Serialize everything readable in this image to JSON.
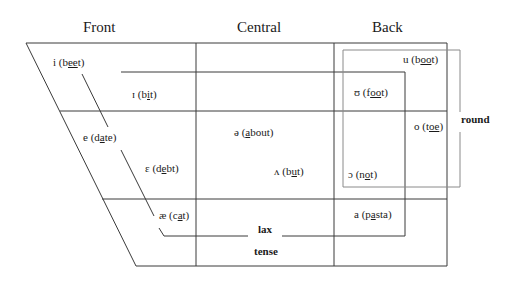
{
  "headers": {
    "front": "Front",
    "central": "Central",
    "back": "Back"
  },
  "vowels": [
    {
      "symbol": "i",
      "pre": "b",
      "ul": "ee",
      "post": "t"
    },
    {
      "symbol": "ɪ",
      "pre": "b",
      "ul": "i",
      "post": "t"
    },
    {
      "symbol": "e",
      "pre": "d",
      "ul": "a",
      "post": "te"
    },
    {
      "symbol": "ɛ",
      "pre": "d",
      "ul": "e",
      "post": "bt"
    },
    {
      "symbol": "æ",
      "pre": "c",
      "ul": "a",
      "post": "t"
    },
    {
      "symbol": "ə",
      "pre": "",
      "ul": "a",
      "post": "bout"
    },
    {
      "symbol": "ʌ",
      "pre": "b",
      "ul": "u",
      "post": "t"
    },
    {
      "symbol": "u",
      "pre": "b",
      "ul": "oo",
      "post": "t"
    },
    {
      "symbol": "ʊ",
      "pre": "f",
      "ul": "oo",
      "post": "t"
    },
    {
      "symbol": "o",
      "pre": "t",
      "ul": "oe",
      "post": ""
    },
    {
      "symbol": "ɔ",
      "pre": "n",
      "ul": "o",
      "post": "t"
    },
    {
      "symbol": "a",
      "pre": "p",
      "ul": "a",
      "post": "sta"
    }
  ],
  "labels": {
    "round": "round",
    "lax": "lax",
    "tense": "tense"
  },
  "colors": {
    "line": "#3a3a3a",
    "round_box": "#8a8a8a"
  }
}
